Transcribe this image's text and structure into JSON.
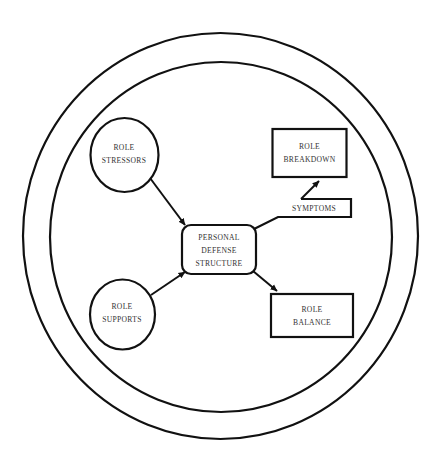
{
  "diagram": {
    "outer_ring": {
      "label": ""
    },
    "inner_ring": {
      "label": ""
    },
    "nodes": {
      "role_stressors": {
        "line1": "ROLE",
        "line2": "STRESSORS",
        "shape": "circle"
      },
      "role_supports": {
        "line1": "ROLE",
        "line2": "SUPPORTS",
        "shape": "circle"
      },
      "personal_defense_structure": {
        "line1": "PERSONAL",
        "line2": "DEFENSE",
        "line3": "STRUCTURE",
        "shape": "rounded-rectangle"
      },
      "role_breakdown": {
        "line1": "ROLE",
        "line2": "BREAKDOWN",
        "shape": "rectangle"
      },
      "role_balance": {
        "line1": "ROLE",
        "line2": "BALANCE",
        "shape": "rectangle"
      },
      "symptoms": {
        "label": "SYMPTOMS",
        "shape": "callout"
      }
    },
    "edges": [
      {
        "from": "role_stressors",
        "to": "personal_defense_structure",
        "type": "arrow"
      },
      {
        "from": "role_supports",
        "to": "personal_defense_structure",
        "type": "arrow"
      },
      {
        "from": "personal_defense_structure",
        "to": "role_balance",
        "type": "arrow"
      },
      {
        "from": "personal_defense_structure",
        "to": "role_breakdown",
        "via": "symptoms",
        "type": "arrow"
      }
    ],
    "colors": {
      "line": "#111111",
      "text": "#333333",
      "background": "#ffffff"
    }
  }
}
